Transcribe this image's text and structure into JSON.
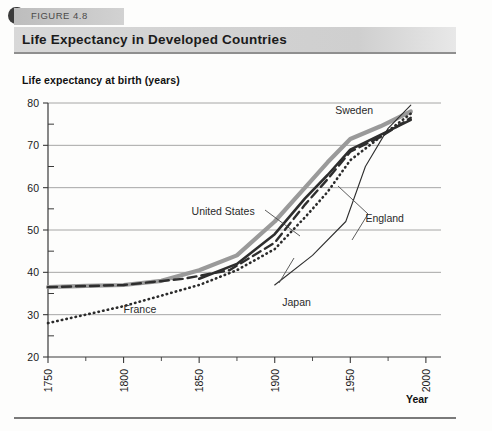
{
  "figure": {
    "number_label": "FIGURE 4.8",
    "title": "Life Expectancy in Developed Countries"
  },
  "chart_data": {
    "type": "line",
    "title": "Life Expectancy in Developed Countries",
    "xlabel": "Year",
    "ylabel": "Life expectancy at birth (years)",
    "xlim": [
      1750,
      2010
    ],
    "ylim": [
      20,
      80
    ],
    "xticks": [
      1750,
      1800,
      1850,
      1900,
      1950,
      2000
    ],
    "xtick_labels": [
      "1750",
      "1800",
      "1850",
      "1900",
      "1950",
      "2000"
    ],
    "yticks": [
      20,
      30,
      40,
      50,
      60,
      70,
      80
    ],
    "ytick_labels": [
      "20",
      "30",
      "40",
      "50",
      "60",
      "70",
      "80"
    ],
    "y_minor_ticks": [
      25,
      35,
      45,
      55,
      65,
      75
    ],
    "grid": "horizontal",
    "legend": "inline-annotations",
    "series": [
      {
        "name": "Sweden",
        "style": "thick-solid-gray",
        "color": "#9a9a9a",
        "x": [
          1750,
          1775,
          1800,
          1825,
          1850,
          1875,
          1900,
          1920,
          1935,
          1950,
          1970,
          1990
        ],
        "values": [
          36.5,
          36.8,
          37.0,
          38.0,
          40.5,
          44.0,
          52.0,
          60.0,
          66.0,
          71.5,
          74.5,
          78.0
        ]
      },
      {
        "name": "United States",
        "style": "solid-black",
        "color": "#2e2e2e",
        "x": [
          1850,
          1875,
          1900,
          1920,
          1935,
          1950,
          1970,
          1990
        ],
        "values": [
          38.5,
          42.0,
          49.0,
          57.5,
          63.0,
          69.0,
          72.5,
          76.0
        ]
      },
      {
        "name": "England",
        "style": "dashed-black",
        "color": "#2e2e2e",
        "x": [
          1750,
          1800,
          1840,
          1870,
          1900,
          1920,
          1935,
          1950,
          1970,
          1990
        ],
        "values": [
          36.5,
          37.0,
          38.5,
          40.5,
          47.0,
          56.0,
          62.0,
          68.5,
          72.0,
          76.5
        ]
      },
      {
        "name": "France",
        "style": "dotted-black",
        "color": "#2b2b2b",
        "x": [
          1750,
          1800,
          1850,
          1875,
          1900,
          1920,
          1935,
          1950,
          1970,
          1990
        ],
        "values": [
          28.0,
          32.0,
          37.0,
          40.5,
          45.5,
          53.0,
          59.0,
          66.5,
          72.0,
          77.5
        ]
      },
      {
        "name": "Japan",
        "style": "thin-solid-black",
        "color": "#2e2e2e",
        "x": [
          1900,
          1925,
          1947,
          1960,
          1975,
          1990
        ],
        "values": [
          37.0,
          44.0,
          52.0,
          65.0,
          74.0,
          79.5
        ]
      }
    ],
    "annotations": [
      {
        "label": "Sweden",
        "x": 1940,
        "y": 77.5
      },
      {
        "label": "United States",
        "x": 1845,
        "y": 53.5
      },
      {
        "label": "England",
        "x": 1960,
        "y": 52.0
      },
      {
        "label": "Japan",
        "x": 1905,
        "y": 32.0
      },
      {
        "label": "France",
        "x": 1800,
        "y": 30.5
      }
    ]
  }
}
